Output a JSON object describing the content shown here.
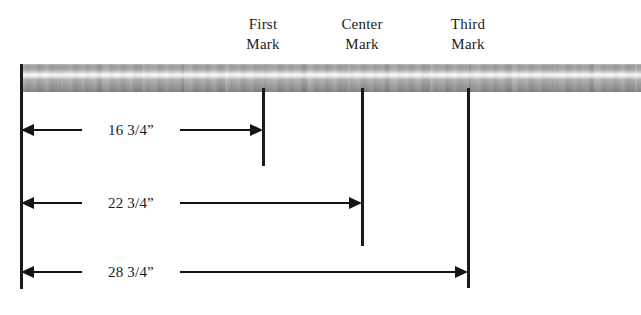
{
  "diagram": {
    "bar": {
      "name": "metal-pipe",
      "left_px": 20,
      "top_px": 64,
      "height_px": 28
    },
    "marks": [
      {
        "id": "first",
        "label_line1": "First",
        "label_line2": "Mark",
        "x_px": 263
      },
      {
        "id": "center",
        "label_line1": "Center",
        "label_line2": "Mark",
        "x_px": 362
      },
      {
        "id": "third",
        "label_line1": "Third",
        "label_line2": "Mark",
        "x_px": 468
      }
    ],
    "dimensions": [
      {
        "id": "dim-first",
        "value": "16 3/4”",
        "y_px": 130,
        "from_px": 21,
        "to_px": 263
      },
      {
        "id": "dim-center",
        "value": "22 3/4”",
        "y_px": 203,
        "from_px": 21,
        "to_px": 362
      },
      {
        "id": "dim-third",
        "value": "28 3/4”",
        "y_px": 272,
        "from_px": 21,
        "to_px": 468
      }
    ],
    "colors": {
      "line": "#141414",
      "text": "#1b1b1b",
      "bar_highlight": "#eeeeee",
      "bar_shadow": "#7c7c7c",
      "background": "#ffffff"
    }
  }
}
